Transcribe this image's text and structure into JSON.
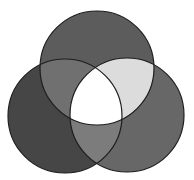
{
  "diagram": {
    "type": "venn",
    "sets": 3,
    "labels": [],
    "circles": [
      {
        "id": "top",
        "cx": 97,
        "cy": 68,
        "r": 57
      },
      {
        "id": "left",
        "cx": 65,
        "cy": 116,
        "r": 57
      },
      {
        "id": "right",
        "cx": 127,
        "cy": 115,
        "r": 57
      }
    ],
    "regions": {
      "top_only": "#5c5c5c",
      "left_only": "#464646",
      "right_only": "#676767",
      "top_left": "#707070",
      "top_right": "#dcdcdc",
      "left_right": "#7c7c7c",
      "all_three": "#ffffff"
    },
    "stroke": "#1e1e1e",
    "background": "#ffffff"
  }
}
